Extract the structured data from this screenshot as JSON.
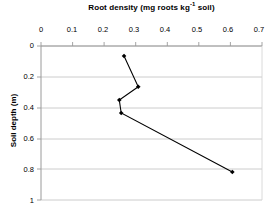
{
  "chart_data": {
    "type": "line",
    "title": "Root density (mg roots kg",
    "title_sup": "-1",
    "title_tail": " soil)",
    "title_full": "Root density (mg roots kg-1 soil)",
    "xlabel": "Root density (mg roots kg-1 soil)",
    "ylabel": "Soil depth (m)",
    "xlim": [
      0,
      0.7
    ],
    "ylim": [
      0,
      1
    ],
    "y_inverted": true,
    "x_axis_position": "top",
    "grid": "horizontal",
    "marker": "diamond",
    "line_color": "#000000",
    "marker_color": "#000000",
    "grid_color": "#c8c8c8",
    "axis_color": "#808080",
    "xticks": [
      "0",
      "0.1",
      "0.2",
      "0.3",
      "0.4",
      "0.5",
      "0.6",
      "0.7"
    ],
    "xtick_values": [
      0,
      0.1,
      0.2,
      0.3,
      0.4,
      0.5,
      0.6,
      0.7
    ],
    "yticks": [
      "0",
      "0.2",
      "0.4",
      "0.6",
      "0.8",
      "1"
    ],
    "ytick_values": [
      0,
      0.2,
      0.4,
      0.6,
      0.8,
      1
    ],
    "x": [
      0.263,
      0.308,
      0.248,
      0.254,
      0.606
    ],
    "y": [
      0.065,
      0.265,
      0.351,
      0.435,
      0.818
    ],
    "points": [
      {
        "density": 0.263,
        "depth": 0.065
      },
      {
        "density": 0.308,
        "depth": 0.265
      },
      {
        "density": 0.248,
        "depth": 0.351
      },
      {
        "density": 0.254,
        "depth": 0.435
      },
      {
        "density": 0.606,
        "depth": 0.818
      }
    ]
  }
}
